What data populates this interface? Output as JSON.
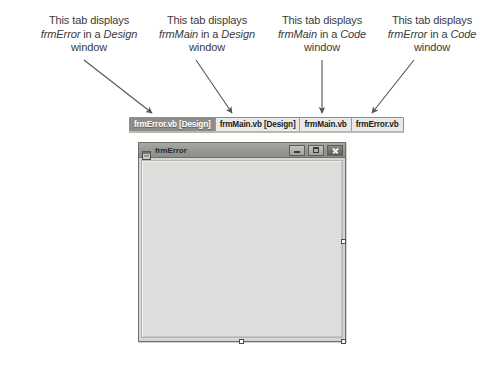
{
  "annotations": [
    {
      "id": "annotation-frmerror-design",
      "line1": "This tab displays",
      "line2_pre": "frmError",
      "line2_mid": " in a ",
      "line2_em": "Design",
      "line3": "window",
      "arrow": "diagonal-down-right"
    },
    {
      "id": "annotation-frmmain-design",
      "line1": "This tab displays",
      "line2_pre": "frmMain",
      "line2_mid": " in a ",
      "line2_em": "Design",
      "line3": "window",
      "arrow": "diagonal-down-right"
    },
    {
      "id": "annotation-frmmain-code",
      "line1": "This tab displays",
      "line2_pre": "frmMain",
      "line2_mid": " in a ",
      "line2_em": "Code",
      "line3": "window",
      "arrow": "straight-down"
    },
    {
      "id": "annotation-frmerror-code",
      "line1": "This tab displays",
      "line2_pre": "frmError",
      "line2_mid": " in a ",
      "line2_em": "Code",
      "line3": "window",
      "arrow": "diagonal-down-left"
    }
  ],
  "tabstrip": {
    "tabs": [
      {
        "label": "frmError.vb [Design]",
        "active": true
      },
      {
        "label": "frmMain.vb [Design]",
        "active": false
      },
      {
        "label": "frmMain.vb",
        "active": false
      },
      {
        "label": "frmError.vb",
        "active": false
      }
    ]
  },
  "form_window": {
    "title": "frmError",
    "icon": "form-designer-icon",
    "buttons": {
      "minimize": "Minimize",
      "maximize": "Maximize",
      "close": "Close"
    },
    "selection_handles": [
      "right-middle",
      "bottom-center",
      "bottom-right"
    ]
  },
  "colors": {
    "page_background": "#ffffff",
    "text": "#3a3a3a",
    "tab_active_bg": "#8d8d88",
    "tab_inactive_bg": "#e9e9e5",
    "tabstrip_bg": "#d8d8d4",
    "form_titlebar": "#9a9a95",
    "form_client": "#dddddb",
    "form_border": "#6e6e6a",
    "handle_fill": "#ffffff",
    "arrow": "#555555"
  }
}
